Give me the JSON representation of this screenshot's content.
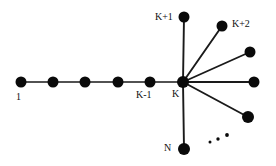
{
  "figure": {
    "background_color": "#ffffff",
    "node_color": "#0a0a0a",
    "edge_color": "#1a1a1a",
    "label_color": "#111111",
    "width": 276,
    "height": 166
  },
  "nodes": [
    {
      "id": "n1",
      "label": "1",
      "cx": 21,
      "cy": 82,
      "r": 5.5,
      "label_x": 16,
      "label_y": 92,
      "label_align": "left",
      "has_label": true
    },
    {
      "id": "n2",
      "label": "",
      "cx": 53,
      "cy": 82,
      "r": 5.5,
      "label_x": 0,
      "label_y": 0,
      "label_align": "left",
      "has_label": false
    },
    {
      "id": "n3",
      "label": "",
      "cx": 85,
      "cy": 82,
      "r": 5.5,
      "label_x": 0,
      "label_y": 0,
      "label_align": "left",
      "has_label": false
    },
    {
      "id": "n4",
      "label": "",
      "cx": 118,
      "cy": 82,
      "r": 5.5,
      "label_x": 0,
      "label_y": 0,
      "label_align": "left",
      "has_label": false
    },
    {
      "id": "nk1",
      "label": "K-1",
      "cx": 150,
      "cy": 82,
      "r": 5.5,
      "label_x": 136,
      "label_y": 90,
      "label_align": "left",
      "has_label": true
    },
    {
      "id": "nk",
      "label": "K",
      "cx": 183,
      "cy": 82,
      "r": 6.0,
      "label_x": 172,
      "label_y": 89,
      "label_align": "left",
      "has_label": true
    },
    {
      "id": "nkp1",
      "label": "K+1",
      "cx": 184,
      "cy": 17,
      "r": 5.5,
      "label_x": 155,
      "label_y": 12,
      "label_align": "right",
      "has_label": true
    },
    {
      "id": "nkp2",
      "label": "K+2",
      "cx": 222,
      "cy": 26,
      "r": 5.5,
      "label_x": 232,
      "label_y": 19,
      "label_align": "left",
      "has_label": true
    },
    {
      "id": "nb1",
      "label": "",
      "cx": 250,
      "cy": 52,
      "r": 5.5,
      "label_x": 0,
      "label_y": 0,
      "label_align": "left",
      "has_label": false
    },
    {
      "id": "nb2",
      "label": "",
      "cx": 254,
      "cy": 82,
      "r": 5.5,
      "label_x": 0,
      "label_y": 0,
      "label_align": "left",
      "has_label": false
    },
    {
      "id": "nb3",
      "label": "",
      "cx": 248,
      "cy": 117,
      "r": 6.0,
      "label_x": 0,
      "label_y": 0,
      "label_align": "left",
      "has_label": false
    },
    {
      "id": "nn",
      "label": "N",
      "cx": 184,
      "cy": 149,
      "r": 6.0,
      "label_x": 164,
      "label_y": 143,
      "label_align": "right",
      "has_label": true
    }
  ],
  "edges": [
    {
      "from": "n1",
      "to": "n2",
      "x1": 21,
      "y1": 82,
      "x2": 53,
      "y2": 82,
      "width": 1.6
    },
    {
      "from": "n2",
      "to": "n3",
      "x1": 53,
      "y1": 82,
      "x2": 85,
      "y2": 82,
      "width": 1.6
    },
    {
      "from": "n3",
      "to": "n4",
      "x1": 85,
      "y1": 82,
      "x2": 118,
      "y2": 82,
      "width": 1.6
    },
    {
      "from": "n4",
      "to": "nk1",
      "x1": 118,
      "y1": 82,
      "x2": 150,
      "y2": 82,
      "width": 1.6
    },
    {
      "from": "nk1",
      "to": "nk",
      "x1": 150,
      "y1": 82,
      "x2": 183,
      "y2": 82,
      "width": 1.6
    },
    {
      "from": "nk",
      "to": "nkp1",
      "x1": 183,
      "y1": 82,
      "x2": 184,
      "y2": 17,
      "width": 1.9
    },
    {
      "from": "nk",
      "to": "nkp2",
      "x1": 183,
      "y1": 82,
      "x2": 222,
      "y2": 26,
      "width": 1.9
    },
    {
      "from": "nk",
      "to": "nb1",
      "x1": 183,
      "y1": 82,
      "x2": 250,
      "y2": 52,
      "width": 1.9
    },
    {
      "from": "nk",
      "to": "nb2",
      "x1": 183,
      "y1": 82,
      "x2": 254,
      "y2": 82,
      "width": 1.9
    },
    {
      "from": "nk",
      "to": "nb3",
      "x1": 183,
      "y1": 82,
      "x2": 248,
      "y2": 117,
      "width": 1.9
    },
    {
      "from": "nk",
      "to": "nn",
      "x1": 183,
      "y1": 82,
      "x2": 184,
      "y2": 149,
      "width": 1.9
    }
  ],
  "ellipsis_dots": [
    {
      "cx": 210,
      "cy": 142,
      "r": 1.5
    },
    {
      "cx": 218,
      "cy": 139,
      "r": 1.7
    },
    {
      "cx": 227,
      "cy": 135,
      "r": 1.9
    }
  ]
}
